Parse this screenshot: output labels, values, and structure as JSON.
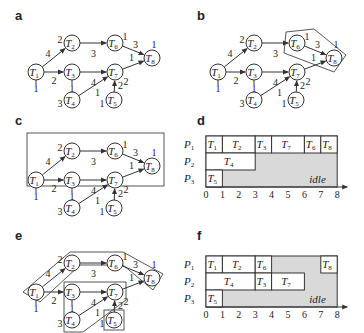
{
  "panels": {
    "a": {
      "label": "a"
    },
    "b": {
      "label": "b"
    },
    "c": {
      "label": "c"
    },
    "d": {
      "label": "d"
    },
    "e": {
      "label": "e"
    },
    "f": {
      "label": "f"
    }
  },
  "graph": {
    "nodes": [
      {
        "id": "T1",
        "name": "T",
        "sub": "1",
        "weight": "1"
      },
      {
        "id": "T2",
        "name": "T",
        "sub": "2",
        "weight": "2"
      },
      {
        "id": "T3",
        "name": "T",
        "sub": "3",
        "weight": "1"
      },
      {
        "id": "T4",
        "name": "T",
        "sub": "4",
        "weight": "3"
      },
      {
        "id": "T5",
        "name": "T",
        "sub": "5",
        "weight": "1"
      },
      {
        "id": "T6",
        "name": "T",
        "sub": "6",
        "weight": "1"
      },
      {
        "id": "T7",
        "name": "T",
        "sub": "7",
        "weight": "2"
      },
      {
        "id": "T8",
        "name": "T",
        "sub": "8",
        "weight": "1"
      }
    ],
    "edges": [
      {
        "from": "T1",
        "to": "T2",
        "weight": "4"
      },
      {
        "from": "T1",
        "to": "T3",
        "weight": "2"
      },
      {
        "from": "T2",
        "to": "T6",
        "weight": "3"
      },
      {
        "from": "T3",
        "to": "T7",
        "weight": "4"
      },
      {
        "from": "T4",
        "to": "T7",
        "weight": "1"
      },
      {
        "from": "T5",
        "to": "T7",
        "weight": "2"
      },
      {
        "from": "T6",
        "to": "T8",
        "weight": "3"
      },
      {
        "from": "T7",
        "to": "T8",
        "weight": "1"
      }
    ]
  },
  "gantt_d": {
    "processors": [
      "P1",
      "P2",
      "P3"
    ],
    "axis_ticks": [
      "0",
      "1",
      "2",
      "3",
      "4",
      "5",
      "6",
      "7",
      "8"
    ],
    "idle_label": "idle",
    "tasks": [
      {
        "proc": "P1",
        "task": "T1",
        "start": 0,
        "end": 1
      },
      {
        "proc": "P1",
        "task": "T2",
        "start": 1,
        "end": 3
      },
      {
        "proc": "P1",
        "task": "T3",
        "start": 3,
        "end": 4
      },
      {
        "proc": "P1",
        "task": "T7",
        "start": 4,
        "end": 6
      },
      {
        "proc": "P1",
        "task": "T6",
        "start": 6,
        "end": 7
      },
      {
        "proc": "P1",
        "task": "T8",
        "start": 7,
        "end": 8
      },
      {
        "proc": "P2",
        "task": "T4",
        "start": 0,
        "end": 3
      },
      {
        "proc": "P3",
        "task": "T5",
        "start": 0,
        "end": 1
      }
    ]
  },
  "gantt_f": {
    "processors": [
      "P1",
      "P2",
      "P3"
    ],
    "axis_ticks": [
      "0",
      "1",
      "2",
      "3",
      "4",
      "5",
      "6",
      "7",
      "8"
    ],
    "idle_label": "idle",
    "tasks": [
      {
        "proc": "P1",
        "task": "T1",
        "start": 0,
        "end": 1
      },
      {
        "proc": "P1",
        "task": "T2",
        "start": 1,
        "end": 3
      },
      {
        "proc": "P1",
        "task": "T6",
        "start": 3,
        "end": 4
      },
      {
        "proc": "P1",
        "task": "T8",
        "start": 7,
        "end": 8
      },
      {
        "proc": "P2",
        "task": "T4",
        "start": 0,
        "end": 3
      },
      {
        "proc": "P2",
        "task": "T3",
        "start": 3,
        "end": 4
      },
      {
        "proc": "P2",
        "task": "T7",
        "start": 4,
        "end": 6
      },
      {
        "proc": "P3",
        "task": "T5",
        "start": 0,
        "end": 1
      }
    ]
  }
}
